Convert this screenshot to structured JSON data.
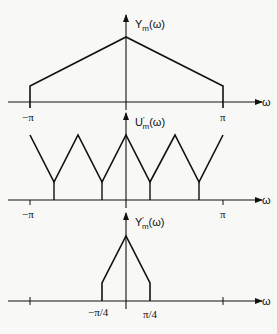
{
  "diagram": {
    "panels": [
      {
        "id": "top",
        "ylabel_main": "Y",
        "ylabel_sub": "m",
        "ylabel_suffix": "(ω)",
        "xlabel": "ω",
        "ticks": {
          "left": "−π",
          "right": "π"
        },
        "shape": "single triangle spanning −π to π, peak at 0, nonzero value at ±π"
      },
      {
        "id": "middle",
        "ylabel_main": "U",
        "ylabel_prime": "'",
        "ylabel_sub": "m",
        "ylabel_suffix": "(ω)",
        "xlabel": "ω",
        "ticks": {
          "left": "−π",
          "right": "π"
        },
        "shape": "periodic triangle train, 4 periods across −π..π (period π/2)"
      },
      {
        "id": "bottom",
        "ylabel_main": "Y",
        "ylabel_prime": "'",
        "ylabel_sub": "m",
        "ylabel_suffix": "(ω)",
        "xlabel": "ω",
        "ticks": {
          "left_inner": "−π/4",
          "right_inner": "π/4"
        },
        "shape": "single triangle spanning −π/4 to π/4, peak at 0"
      }
    ]
  },
  "colors": {
    "line": "#111111",
    "background": "#f8f8f6"
  }
}
